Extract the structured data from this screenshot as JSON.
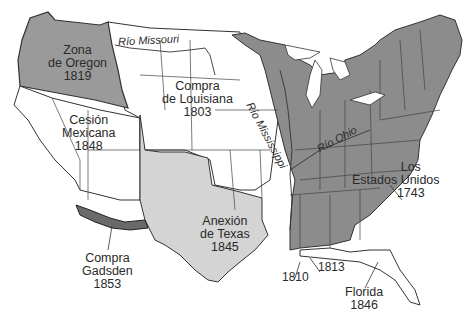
{
  "map": {
    "title": "",
    "colors": {
      "original_states": "#8c8c8c",
      "oregon": "#9a9a9a",
      "texas": "#d4d4d4",
      "gadsden": "#6a6a6a",
      "unshaded": "#ffffff",
      "border": "#333333"
    },
    "regions": [
      {
        "id": "oregon",
        "name": "Zona",
        "name2": "de Oregon",
        "year": "1819"
      },
      {
        "id": "louisiana",
        "name": "Compra",
        "name2": "de Louisiana",
        "year": "1803"
      },
      {
        "id": "mexican-cession",
        "name": "Cesión",
        "name2": "Mexicana",
        "year": "1848"
      },
      {
        "id": "texas",
        "name": "Anexión",
        "name2": "de Texas",
        "year": "1845"
      },
      {
        "id": "gadsden",
        "name": "Compra",
        "name2": "Gadsden",
        "year": "1853"
      },
      {
        "id": "united-states",
        "name": "Los",
        "name2": "Estados Unidos",
        "year": "1743"
      },
      {
        "id": "florida",
        "name": "Florida",
        "year": "1846"
      }
    ],
    "rivers": [
      {
        "id": "missouri",
        "label": "Río Missouri"
      },
      {
        "id": "mississippi",
        "label": "Río Mississippi"
      },
      {
        "id": "ohio",
        "label": "Río Ohio"
      }
    ],
    "small_acquisitions": [
      {
        "id": "west-florida-1810",
        "year": "1810"
      },
      {
        "id": "west-florida-1813",
        "year": "1813"
      }
    ]
  }
}
